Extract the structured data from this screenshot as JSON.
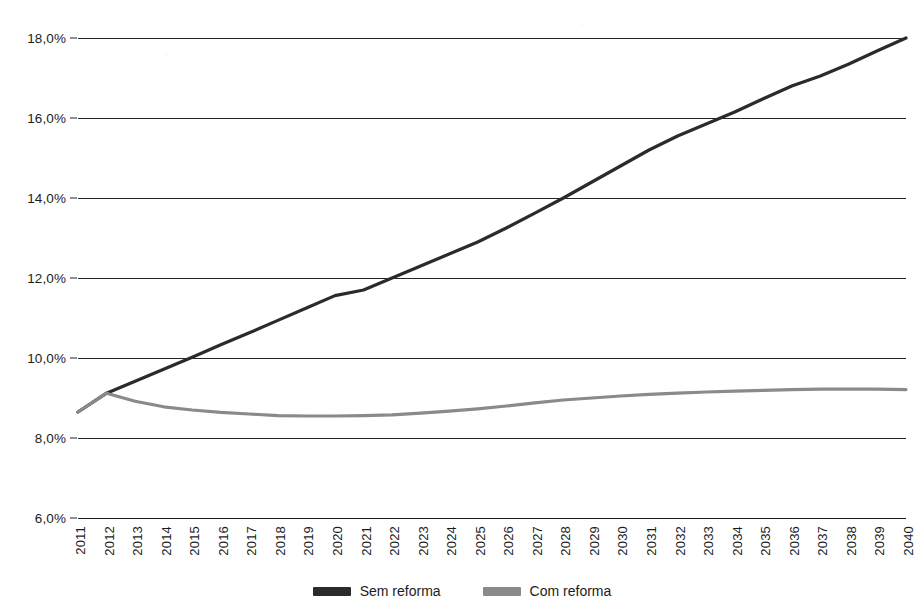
{
  "chart_data": {
    "type": "line",
    "title": "",
    "xlabel": "",
    "ylabel": "",
    "ylim": [
      6.0,
      18.0
    ],
    "ytick_values": [
      18.0,
      16.0,
      14.0,
      12.0,
      10.0,
      8.0,
      6.0
    ],
    "ytick_labels": [
      "18,0%",
      "16,0%",
      "14,0%",
      "12,0%",
      "10,0%",
      "8,0%",
      "6,0%"
    ],
    "grid": true,
    "legend_position": "bottom-center",
    "categories": [
      "2011",
      "2012",
      "2013",
      "2014",
      "2015",
      "2016",
      "2017",
      "2018",
      "2019",
      "2020",
      "2021",
      "2022",
      "2023",
      "2024",
      "2025",
      "2026",
      "2027",
      "2028",
      "2029",
      "2030",
      "2031",
      "2032",
      "2033",
      "2034",
      "2035",
      "2036",
      "2037",
      "2038",
      "2039",
      "2040"
    ],
    "series": [
      {
        "name": "Sem reforma",
        "color": "#2b2b2b",
        "values": [
          8.65,
          9.12,
          9.42,
          9.72,
          10.02,
          10.33,
          10.63,
          10.94,
          11.25,
          11.56,
          11.7,
          12.0,
          12.3,
          12.6,
          12.9,
          13.25,
          13.62,
          14.0,
          14.4,
          14.8,
          15.2,
          15.55,
          15.85,
          16.15,
          16.48,
          16.8,
          17.05,
          17.35,
          17.68,
          18.0
        ]
      },
      {
        "name": "Com reforma",
        "color": "#8a8a8a",
        "values": [
          8.65,
          9.12,
          8.92,
          8.78,
          8.7,
          8.64,
          8.6,
          8.56,
          8.55,
          8.55,
          8.56,
          8.58,
          8.62,
          8.67,
          8.73,
          8.8,
          8.88,
          8.95,
          9.0,
          9.05,
          9.09,
          9.12,
          9.15,
          9.17,
          9.19,
          9.21,
          9.22,
          9.22,
          9.22,
          9.21
        ]
      }
    ]
  },
  "legend": {
    "items": [
      {
        "label": "Sem reforma",
        "color": "#2b2b2b"
      },
      {
        "label": "Com reforma",
        "color": "#8a8a8a"
      }
    ]
  }
}
